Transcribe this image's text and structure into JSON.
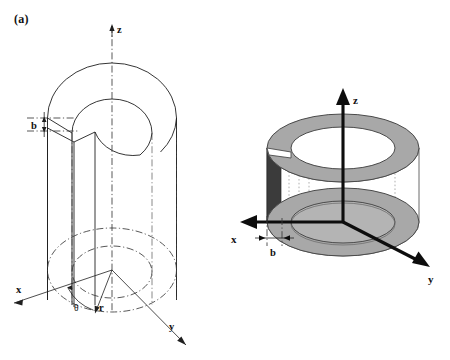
{
  "figure": {
    "caption_panels": [
      "(a)",
      "(b)"
    ],
    "background_color": "#ffffff",
    "line_color": "#1f1f1f"
  },
  "panel_a": {
    "label": "(a)",
    "style": "line drawing, cylindrical coordinates",
    "axes": [
      {
        "name": "z",
        "label": "z",
        "direction": "up",
        "arrow": true
      },
      {
        "name": "x",
        "label": "x",
        "direction": "lower-left",
        "arrow": true
      },
      {
        "name": "y",
        "label": "y",
        "direction": "lower-right",
        "arrow": true
      }
    ],
    "annotations": [
      {
        "name": "slit-width",
        "label": "b",
        "type": "dimension"
      },
      {
        "name": "radius",
        "label": "r",
        "type": "coordinate"
      },
      {
        "name": "angle",
        "label": "θ",
        "type": "coordinate"
      }
    ],
    "geometry": {
      "shape": "hollow cylinder with longitudinal slit",
      "top_face": "annulus outline",
      "bottom_face": "hidden annulus, dash-dot",
      "slit_location": "left side"
    }
  },
  "panel_b": {
    "label": "(b)",
    "style": "shaded 3D rendering, Cartesian axes",
    "axes": [
      {
        "name": "z",
        "label": "z",
        "direction": "up",
        "arrow": true
      },
      {
        "name": "x",
        "label": "x",
        "direction": "left",
        "arrow": true
      },
      {
        "name": "y",
        "label": "y",
        "direction": "lower-right",
        "arrow": true
      }
    ],
    "annotations": [
      {
        "name": "slit-width",
        "label": "b",
        "type": "dimension"
      }
    ],
    "geometry": {
      "shape": "hollow cylinder with longitudinal slit",
      "ring_fill": "#a8a8a8",
      "ring_edge": "#4a4a4a",
      "slit_face_fill": "#3b3b3b",
      "body_fill": "#ffffff"
    }
  },
  "colors": {
    "ink": "#1f1f1f",
    "ring_gray": "#a8a8a8",
    "ring_gray_dark": "#8c8c8c",
    "slit_dark": "#3b3b3b",
    "axis_black": "#0d0d0d",
    "centerline_gray": "#3a3a3a"
  }
}
